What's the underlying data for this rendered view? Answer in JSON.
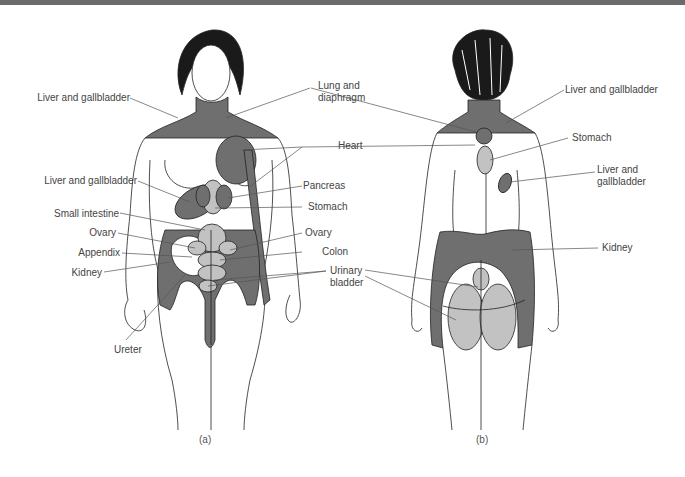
{
  "figure": {
    "colors": {
      "dark_region": "#6f6f6f",
      "light_region": "#c2c2c2",
      "outline": "#222222",
      "leader": "#555555",
      "top_rule": "#6b6b6b"
    },
    "panel_a": {
      "caption": "(a)",
      "labels": {
        "liver_gallbladder_top": "Liver and gallbladder",
        "lung_diaphragm_1": "Lung and",
        "lung_diaphragm_2": "diaphragm",
        "heart": "Heart",
        "liver_gallbladder_mid": "Liver and gallbladder",
        "pancreas": "Pancreas",
        "small_intestine": "Small intestine",
        "stomach": "Stomach",
        "ovary_left": "Ovary",
        "ovary_right": "Ovary",
        "appendix": "Appendix",
        "colon": "Colon",
        "kidney": "Kidney",
        "urinary_bladder_1": "Urinary",
        "urinary_bladder_2": "bladder",
        "ureter": "Ureter"
      }
    },
    "panel_b": {
      "caption": "(b)",
      "labels": {
        "liver_gallbladder_top": "Liver and gallbladder",
        "stomach": "Stomach",
        "liver_gallbladder_1": "Liver and",
        "liver_gallbladder_2": "gallbladder",
        "kidney": "Kidney"
      }
    }
  }
}
